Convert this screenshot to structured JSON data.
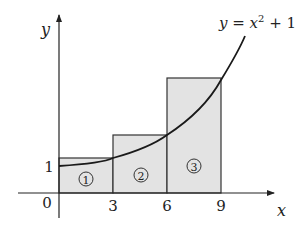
{
  "diagram": {
    "type": "riemann-sum",
    "equation": {
      "prefix": "y = x",
      "exponent": "2",
      "suffix": " + 1"
    },
    "axes": {
      "x_label": "x",
      "y_label": "y",
      "origin_label": "0",
      "y_tick_label": "1",
      "x_tick_labels": [
        "3",
        "6",
        "9"
      ]
    },
    "rectangles": [
      {
        "label": "①",
        "x_from": 0,
        "x_to": 3
      },
      {
        "label": "②",
        "x_from": 3,
        "x_to": 6
      },
      {
        "label": "③",
        "x_from": 6,
        "x_to": 9
      }
    ],
    "colors": {
      "fill": "#e3e3e3",
      "stroke": "#333333",
      "curve": "#1a1a1a"
    }
  }
}
